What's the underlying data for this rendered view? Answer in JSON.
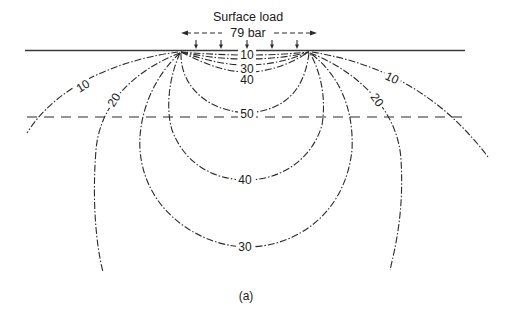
{
  "diagram": {
    "title": "Surface load",
    "load_value": "79 bar",
    "caption": "(a)",
    "contour_labels": {
      "left_10": "10",
      "left_20": "20",
      "right_10": "10",
      "right_20": "20",
      "inner_10": "10",
      "inner_30": "30",
      "inner_40": "40",
      "inner_50": "50",
      "outer_40": "40",
      "outer_30": "30"
    },
    "load_arrow_count": 5,
    "line_color": "#2a2a2a",
    "background": "#ffffff"
  }
}
